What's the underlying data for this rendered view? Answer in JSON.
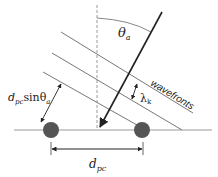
{
  "diagram": {
    "labels": {
      "angle": "θ",
      "angle_sub": "a",
      "wavefronts": "wavefronts",
      "wavelength": "λ",
      "wavelength_sub": "k",
      "path_diff_d": "d",
      "path_diff_sub": "pc",
      "path_diff_sin": "sinθ",
      "path_diff_sin_sub": "a",
      "spacing_d": "d",
      "spacing_sub": "pc"
    },
    "colors": {
      "line": "#888888",
      "arrow": "#222222",
      "element": "#555555",
      "dashed": "#999999"
    }
  }
}
